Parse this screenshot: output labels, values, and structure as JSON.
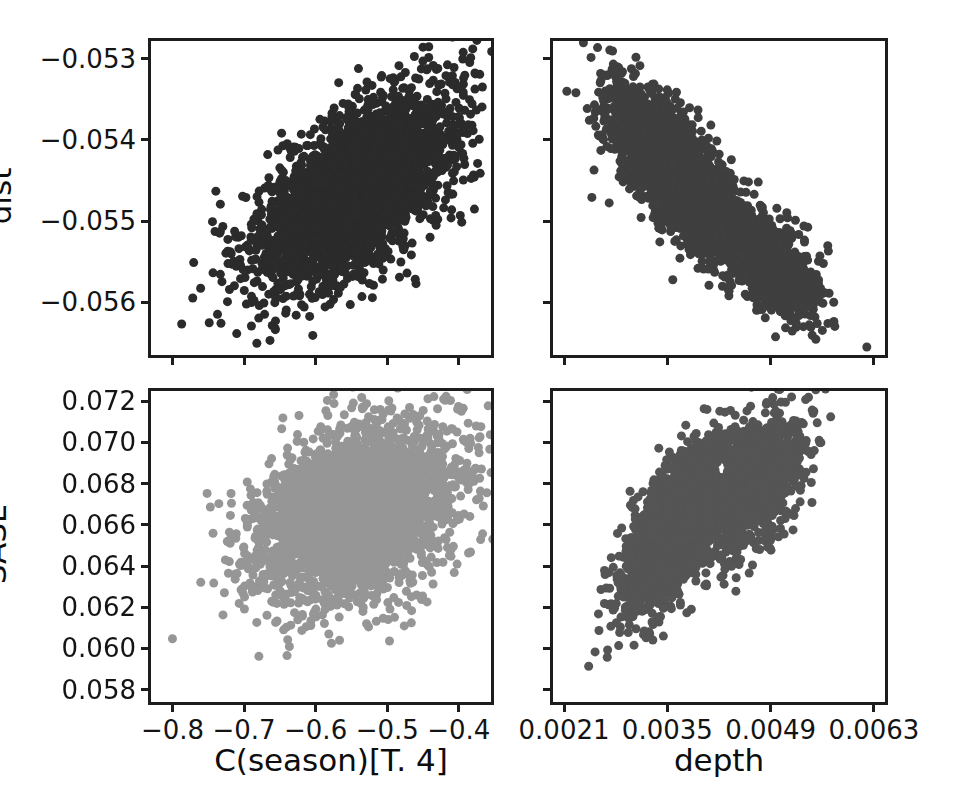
{
  "figure": {
    "background_color": "#ffffff",
    "axis_color": "#1d1d1d",
    "text_color": "#141414"
  },
  "chart_data": [
    {
      "type": "scatter",
      "panel": "top-left",
      "title": "",
      "xlabel": "C(season)[T. 4]",
      "ylabel": "dist",
      "xlim": [
        -0.83,
        -0.355
      ],
      "ylim": [
        -0.05665,
        -0.05278
      ],
      "xticks": [
        -0.8,
        -0.7,
        -0.6,
        -0.5,
        -0.4
      ],
      "xtick_labels": [
        "−0.8",
        "−0.7",
        "−0.6",
        "−0.5",
        "−0.4"
      ],
      "yticks": [
        -0.053,
        -0.054,
        -0.055,
        -0.056
      ],
      "ytick_labels": [
        "−0.053",
        "−0.054",
        "−0.055",
        "−0.056"
      ],
      "grid": false,
      "legend": "none",
      "marker_color": "#2b2b2b",
      "marker_size": 9,
      "n_points": 3400,
      "correlation": 0.62,
      "x_mean": -0.545,
      "x_sd": 0.068,
      "y_mean": -0.05465,
      "y_sd": 0.00058,
      "clusters": [
        {
          "weight": 1.0,
          "x_mean": -0.545,
          "y_mean": -0.05465,
          "x_sd": 0.068,
          "y_sd": 0.00058,
          "corr": 0.62
        }
      ]
    },
    {
      "type": "scatter",
      "panel": "top-right",
      "title": "",
      "xlabel": "depth",
      "ylabel": "dist",
      "xlim": [
        0.00195,
        0.00645
      ],
      "ylim": [
        -0.05665,
        -0.05278
      ],
      "xticks": [
        0.0021,
        0.0035,
        0.0049,
        0.0063
      ],
      "xtick_labels": [
        "0.0021",
        "0.0035",
        "0.0049",
        "0.0063"
      ],
      "yticks": [
        -0.053,
        -0.054,
        -0.055,
        -0.056
      ],
      "ytick_labels": [
        "−0.053",
        "−0.054",
        "−0.055",
        "−0.056"
      ],
      "grid": false,
      "legend": "none",
      "marker_color": "#3f3f3f",
      "marker_size": 9,
      "n_points": 3400,
      "correlation": -0.82,
      "x_mean": 0.00392,
      "x_sd": 0.00062,
      "y_mean": -0.05465,
      "y_sd": 0.00058,
      "clusters": [
        {
          "weight": 0.72,
          "x_mean": 0.00359,
          "y_mean": -0.05437,
          "x_sd": 0.00042,
          "y_sd": 0.00048,
          "corr": -0.72
        },
        {
          "weight": 0.28,
          "x_mean": 0.00477,
          "y_mean": -0.05545,
          "x_sd": 0.00037,
          "y_sd": 0.00036,
          "corr": -0.6
        }
      ]
    },
    {
      "type": "scatter",
      "panel": "bottom-left",
      "title": "",
      "xlabel": "C(season)[T. 4]",
      "ylabel": "SASL",
      "xlim": [
        -0.83,
        -0.355
      ],
      "ylim": [
        0.0574,
        0.0725
      ],
      "xticks": [
        -0.8,
        -0.7,
        -0.6,
        -0.5,
        -0.4
      ],
      "xtick_labels": [
        "−0.8",
        "−0.7",
        "−0.6",
        "−0.5",
        "−0.4"
      ],
      "yticks": [
        0.072,
        0.07,
        0.068,
        0.066,
        0.064,
        0.062,
        0.06,
        0.058
      ],
      "ytick_labels": [
        "0.072",
        "0.070",
        "0.068",
        "0.066",
        "0.064",
        "0.062",
        "0.060",
        "0.058"
      ],
      "grid": false,
      "legend": "none",
      "marker_color": "#969696",
      "marker_size": 9,
      "n_points": 3400,
      "correlation": 0.35,
      "x_mean": -0.545,
      "x_sd": 0.068,
      "y_mean": 0.0665,
      "y_sd": 0.0021,
      "clusters": [
        {
          "weight": 1.0,
          "x_mean": -0.545,
          "y_mean": 0.0665,
          "x_sd": 0.068,
          "y_sd": 0.0021,
          "corr": 0.35
        }
      ]
    },
    {
      "type": "scatter",
      "panel": "bottom-right",
      "title": "",
      "xlabel": "depth",
      "ylabel": "SASL",
      "xlim": [
        0.00195,
        0.00645
      ],
      "ylim": [
        0.0574,
        0.0725
      ],
      "xticks": [
        0.0021,
        0.0035,
        0.0049,
        0.0063
      ],
      "xtick_labels": [
        "0.0021",
        "0.0035",
        "0.0049",
        "0.0063"
      ],
      "yticks": [
        0.072,
        0.07,
        0.068,
        0.066,
        0.064,
        0.062,
        0.06,
        0.058
      ],
      "ytick_labels": [
        "0.072",
        "0.070",
        "0.068",
        "0.066",
        "0.064",
        "0.062",
        "0.060",
        "0.058"
      ],
      "grid": false,
      "legend": "none",
      "marker_color": "#555555",
      "marker_size": 9,
      "n_points": 3400,
      "correlation": 0.78,
      "x_mean": 0.00392,
      "x_sd": 0.00062,
      "y_mean": 0.0665,
      "y_sd": 0.0021,
      "clusters": [
        {
          "weight": 0.72,
          "x_mean": 0.00363,
          "y_mean": 0.06595,
          "x_sd": 0.00036,
          "y_sd": 0.00195,
          "corr": 0.68
        },
        {
          "weight": 0.28,
          "x_mean": 0.00472,
          "y_mean": 0.06805,
          "x_sd": 0.00032,
          "y_sd": 0.0017,
          "corr": 0.55
        }
      ]
    }
  ],
  "axis_labels": {
    "x_left": "C(season)[T. 4]",
    "x_right": "depth",
    "y_top": "dist",
    "y_bottom": "SASL"
  }
}
